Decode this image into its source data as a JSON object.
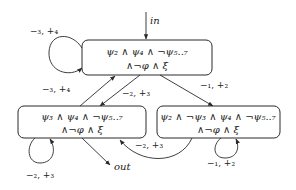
{
  "diagram": {
    "states": [
      {
        "id": "top",
        "line1": "ψ₂ ∧ ψ₄ ∧ ¬ψ₅..₇",
        "line2": "∧¬φ ∧ ξ"
      },
      {
        "id": "bottom_left",
        "line1": "ψ₃ ∧ ψ₄ ∧ ¬ψ₅..₇",
        "line2": "∧¬φ ∧ ξ"
      },
      {
        "id": "bottom_right",
        "line1": "ψ₂ ∧ ¬ψ₃ ∧ ψ₄ ∧ ¬ψ₅..₇",
        "line2": "∧¬φ ∧ ξ"
      }
    ],
    "edges": [
      {
        "from": "top",
        "to": "top",
        "label": "−₃, +₄"
      },
      {
        "from": "bottom_left",
        "to": "top",
        "label": "−₃, +₄"
      },
      {
        "from": "top",
        "to": "bottom_left",
        "label": "−₂, +₃"
      },
      {
        "from": "top",
        "to": "bottom_right",
        "label": "−₁, +₂"
      },
      {
        "from": "bottom_right",
        "to": "bottom_left",
        "label": "−₂, +₃"
      },
      {
        "from": "bottom_left",
        "to": "bottom_left",
        "label": "−₂, +₃"
      },
      {
        "from": "bottom_right",
        "to": "bottom_right",
        "label": "−₁, +₂"
      }
    ],
    "entry_label": "in",
    "exit_label": "out"
  }
}
